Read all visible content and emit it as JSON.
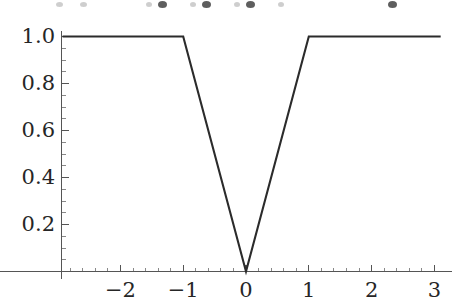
{
  "chart_data": {
    "type": "line",
    "title": "",
    "subtitle": "",
    "xlabel": "",
    "ylabel": "",
    "xlim": [
      -2.92,
      3.13
    ],
    "ylim": [
      0,
      1.03
    ],
    "grid": false,
    "legend": null,
    "legend_position": "none",
    "line_color": "#2b2b2b",
    "axis_color": "#555555",
    "text_color": "#262626",
    "x_ticks": [
      -2,
      -1,
      0,
      1,
      2,
      3
    ],
    "x_tick_labels": [
      "−2",
      "−1",
      "0",
      "1",
      "2",
      "3"
    ],
    "x_minor_tick_step": 0.2,
    "y_ticks": [
      0.2,
      0.4,
      0.6,
      0.8,
      1.0
    ],
    "y_tick_labels": [
      "0.2",
      "0.4",
      "0.6",
      "0.8",
      "1.0"
    ],
    "y_minor_tick_step": 0.05,
    "annotation": "piecewise clipped absolute value: f(x) = min(|x|, 1)",
    "series": [
      {
        "name": "f(x) = min(|x|, 1)",
        "x": [
          -2.92,
          -1.0,
          0.0,
          1.0,
          3.1
        ],
        "y": [
          1.0,
          1.0,
          0.0,
          1.0,
          1.0
        ]
      }
    ],
    "vertices": [
      {
        "x": -2.92,
        "y": 1.0
      },
      {
        "x": -1.0,
        "y": 1.0
      },
      {
        "x": 0.0,
        "y": 0.0
      },
      {
        "x": 1.0,
        "y": 1.0
      },
      {
        "x": 3.1,
        "y": 1.0
      }
    ]
  },
  "axes": {
    "y_labels": [
      {
        "text": "1.0",
        "value": 1.0
      },
      {
        "text": "0.8",
        "value": 0.8
      },
      {
        "text": "0.6",
        "value": 0.6
      },
      {
        "text": "0.4",
        "value": 0.4
      },
      {
        "text": "0.2",
        "value": 0.2
      }
    ],
    "x_labels": [
      {
        "text": "−2",
        "value": -2
      },
      {
        "text": "−1",
        "value": -1
      },
      {
        "text": "0",
        "value": 0
      },
      {
        "text": "1",
        "value": 1
      },
      {
        "text": "2",
        "value": 2
      },
      {
        "text": "3",
        "value": 3
      }
    ]
  }
}
